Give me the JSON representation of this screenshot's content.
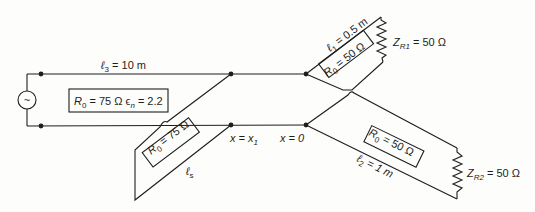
{
  "diagram": {
    "type": "transmission-line circuit",
    "source": {
      "symbol": "~",
      "icon": "ac-source-icon"
    },
    "main_line": {
      "length_label": "ℓ",
      "length_sub": "3",
      "length_value": " = 10 m",
      "param_R": "R",
      "param_R_sub": "0",
      "param_value": " = 75 Ω ϵ",
      "param_eps_sub": "n",
      "param_eps_value": " = 2.2"
    },
    "stub_s": {
      "param_R": "R",
      "param_R_sub": "0",
      "param_value": " = 75 Ω",
      "length_label": "ℓ",
      "length_sub": "s"
    },
    "branch1": {
      "length_label": "ℓ",
      "length_sub": "1",
      "length_value": " = 0.5 m",
      "param_R": "R",
      "param_R_sub": "0",
      "param_value": " = 50 Ω",
      "load_label": "Z",
      "load_sub": "R1",
      "load_value": " = 50 Ω"
    },
    "branch2": {
      "length_label": "ℓ",
      "length_sub": "2",
      "length_value": " = 1 m",
      "param_R": "R",
      "param_R_sub": "0",
      "param_value": " = 50 Ω",
      "load_label": "Z",
      "load_sub": "R2",
      "load_value": " = 50 Ω"
    },
    "positions": {
      "x1_label": "x = x",
      "x1_sub": "1",
      "x0_label": "x = 0"
    }
  }
}
